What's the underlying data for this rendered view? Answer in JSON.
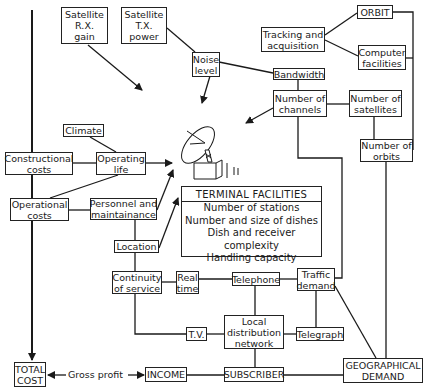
{
  "diagram": {
    "nodes": {
      "sat_rx_gain": [
        "Satellite",
        "R.X.",
        "gain"
      ],
      "sat_tx_power": [
        "Satellite",
        "T.X.",
        "power"
      ],
      "noise_level": [
        "Noise",
        "level"
      ],
      "orbit": [
        "ORBIT"
      ],
      "tracking": [
        "Tracking and",
        "acquisition"
      ],
      "computer": [
        "Computer",
        "facilities"
      ],
      "bandwidth": [
        "Bandwidth"
      ],
      "num_channels": [
        "Number of",
        "channels"
      ],
      "num_satellites": [
        "Number of",
        "satellites"
      ],
      "climate": [
        "Climate"
      ],
      "constructional": [
        "Constructional",
        "costs"
      ],
      "operating_life": [
        "Operating",
        "life"
      ],
      "operational": [
        "Operational",
        "costs"
      ],
      "personnel": [
        "Personnel and",
        "maintainance"
      ],
      "location": [
        "Location"
      ],
      "num_orbits": [
        "Number of",
        "orbits"
      ],
      "continuity": [
        "Continuity",
        "of service"
      ],
      "real_time": [
        "Real",
        "time"
      ],
      "telephone": [
        "Telephone"
      ],
      "traffic": [
        "Traffic",
        "demand"
      ],
      "local_dist": [
        "Local",
        "distribution",
        "network"
      ],
      "telegraph": [
        "Telegraph"
      ],
      "tv": [
        "T.V."
      ],
      "total_cost": [
        "TOTAL",
        "COST"
      ],
      "income": [
        "INCOME"
      ],
      "subscriber": [
        "SUBSCRIBER"
      ],
      "geo_demand": [
        "GEOGRAPHICAL",
        "DEMAND"
      ]
    },
    "terminal_facilities": {
      "title": "TERMINAL FACILITIES",
      "items": [
        "Number of stations",
        "Number and size of dishes",
        "Dish and receiver complexity",
        "Handling capacity"
      ]
    },
    "edge_label_gross_profit": "Gross profit",
    "dish_icon": "satellite-dish-antenna-icon",
    "colors": {
      "line": "#1a1a1a",
      "background": "#ffffff"
    }
  }
}
